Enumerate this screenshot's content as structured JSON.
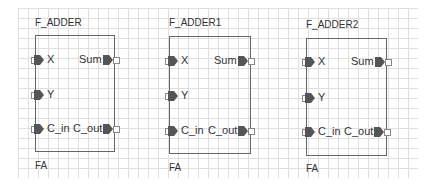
{
  "canvas": {
    "grid_color": "#dcdcdc",
    "grid_size_px": 10
  },
  "blocks": [
    {
      "instance_name": "F_ADDER",
      "type_name": "FA",
      "inputs": [
        "X",
        "Y",
        "C_in"
      ],
      "outputs": [
        "Sum",
        "C_out"
      ]
    },
    {
      "instance_name": "F_ADDER1",
      "type_name": "FA",
      "inputs": [
        "X",
        "Y",
        "C_in"
      ],
      "outputs": [
        "Sum",
        "C_out"
      ]
    },
    {
      "instance_name": "F_ADDER2",
      "type_name": "FA",
      "inputs": [
        "X",
        "Y",
        "C_in"
      ],
      "outputs": [
        "Sum",
        "C_out"
      ]
    }
  ]
}
